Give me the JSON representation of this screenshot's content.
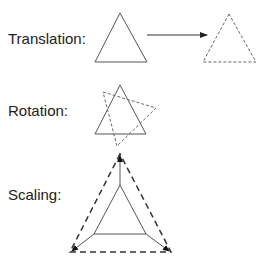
{
  "diagram": {
    "sections": [
      {
        "id": "translation",
        "label": "Translation:",
        "label_pos": [
          8,
          44
        ],
        "original": [
          [
            120,
            13
          ],
          [
            95,
            62
          ],
          [
            147,
            62
          ]
        ],
        "transformed": [
          [
            229,
            14
          ],
          [
            203,
            62
          ],
          [
            256,
            62
          ]
        ],
        "arrow": {
          "from": [
            147,
            35
          ],
          "to": [
            207,
            35
          ]
        }
      },
      {
        "id": "rotation",
        "label": "Rotation:",
        "label_pos": [
          8,
          116
        ],
        "original": [
          [
            120,
            85
          ],
          [
            95,
            134
          ],
          [
            146,
            134
          ]
        ],
        "transformed": [
          [
            103,
            92
          ],
          [
            156,
            108
          ],
          [
            117,
            146
          ]
        ]
      },
      {
        "id": "scaling",
        "label": "Scaling:",
        "label_pos": [
          8,
          200
        ],
        "original": [
          [
            120,
            185
          ],
          [
            94,
            234
          ],
          [
            146,
            234
          ]
        ],
        "transformed": [
          [
            120,
            154
          ],
          [
            70,
            252
          ],
          [
            171,
            252
          ]
        ]
      }
    ],
    "colors": {
      "solid": "#555555",
      "dashed": "#333333",
      "text": "#222222",
      "background": "#ffffff"
    }
  }
}
